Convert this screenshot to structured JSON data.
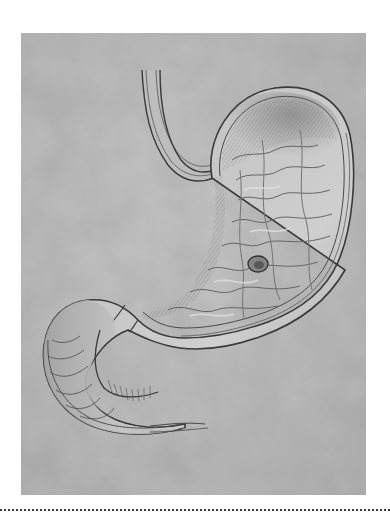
{
  "figure": {
    "alt": "Anatomical illustration of a stomach with esophagus and duodenum, showing a gastric ulcer",
    "style": "grayscale pencil illustration on mottled gray background",
    "colors": {
      "page_background": "#ffffff",
      "image_background": "#b8b8b8",
      "organ_light": "#d2d2d2",
      "organ_mid": "#a9a9a9",
      "outline": "#3c3c3c",
      "divider": "#3a3a3a"
    },
    "labels": []
  },
  "layout": {
    "image_box": {
      "x": 21,
      "y": 33,
      "width": 345,
      "height": 462
    },
    "divider_y": 509
  }
}
